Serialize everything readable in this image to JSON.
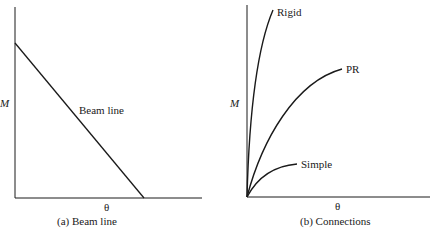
{
  "panel_a": {
    "caption": "(a) Beam line",
    "y_label": "M",
    "x_label": "θ",
    "line_label": "Beam line"
  },
  "panel_b": {
    "caption": "(b) Connections",
    "y_label": "M",
    "x_label": "θ",
    "curves": [
      {
        "label": "Rigid"
      },
      {
        "label": "PR"
      },
      {
        "label": "Simple"
      }
    ]
  },
  "colors": {
    "line": "#1a1a1a",
    "background": "#ffffff"
  }
}
